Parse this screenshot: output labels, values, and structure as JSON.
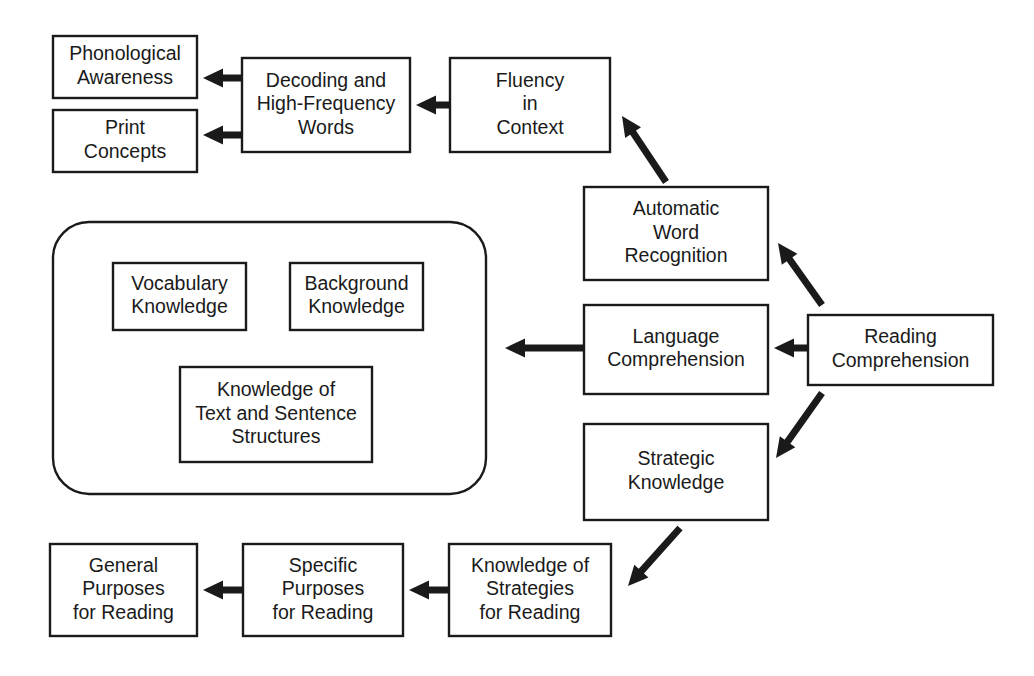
{
  "diagram": {
    "type": "flow-diagram",
    "background_color": "#ffffff",
    "line_color": "#1a1a1a",
    "box_fill": "#ffffff",
    "nodes": [
      {
        "id": "phonological-awareness",
        "lines": [
          "Phonological",
          "Awareness"
        ],
        "x": 53,
        "y": 36,
        "w": 144,
        "h": 62
      },
      {
        "id": "print-concepts",
        "lines": [
          "Print",
          "Concepts"
        ],
        "x": 53,
        "y": 110,
        "w": 144,
        "h": 62
      },
      {
        "id": "decoding-and-high-frequency-words",
        "lines": [
          "Decoding and",
          "High-Frequency",
          "Words"
        ],
        "x": 242,
        "y": 58,
        "w": 168,
        "h": 94
      },
      {
        "id": "fluency-in-context",
        "lines": [
          "Fluency",
          "in",
          "Context"
        ],
        "x": 450,
        "y": 58,
        "w": 160,
        "h": 94
      },
      {
        "id": "automatic-word-recognition",
        "lines": [
          "Automatic",
          "Word",
          "Recognition"
        ],
        "x": 584,
        "y": 187,
        "w": 184,
        "h": 93
      },
      {
        "id": "language-comprehension",
        "lines": [
          "Language",
          "Comprehension"
        ],
        "x": 584,
        "y": 305,
        "w": 184,
        "h": 89
      },
      {
        "id": "strategic-knowledge",
        "lines": [
          "Strategic",
          "Knowledge"
        ],
        "x": 584,
        "y": 424,
        "w": 184,
        "h": 96
      },
      {
        "id": "reading-comprehension",
        "lines": [
          "Reading",
          "Comprehension"
        ],
        "x": 808,
        "y": 315,
        "w": 185,
        "h": 70
      },
      {
        "id": "vocabulary-knowledge",
        "lines": [
          "Vocabulary",
          "Knowledge"
        ],
        "x": 113,
        "y": 263,
        "w": 133,
        "h": 67
      },
      {
        "id": "background-knowledge",
        "lines": [
          "Background",
          "Knowledge"
        ],
        "x": 290,
        "y": 263,
        "w": 133,
        "h": 67
      },
      {
        "id": "knowledge-of-text-and-sentence-structures",
        "lines": [
          "Knowledge of",
          "Text and Sentence",
          "Structures"
        ],
        "x": 180,
        "y": 367,
        "w": 192,
        "h": 95
      },
      {
        "id": "general-purposes-for-reading",
        "lines": [
          "General",
          "Purposes",
          "for Reading"
        ],
        "x": 50,
        "y": 544,
        "w": 147,
        "h": 92
      },
      {
        "id": "specific-purposes-for-reading",
        "lines": [
          "Specific",
          "Purposes",
          "for Reading"
        ],
        "x": 243,
        "y": 544,
        "w": 160,
        "h": 92
      },
      {
        "id": "knowledge-of-strategies-for-reading",
        "lines": [
          "Knowledge of",
          "Strategies",
          "for Reading"
        ],
        "x": 449,
        "y": 544,
        "w": 162,
        "h": 92
      }
    ],
    "group_container": {
      "id": "language-comprehension-group",
      "x": 53,
      "y": 222,
      "w": 433,
      "h": 272,
      "radius": 36
    },
    "edges": [
      {
        "id": "edge-decoding-to-phonological-awareness",
        "from": "decoding-and-high-frequency-words",
        "to": "phonological-awareness",
        "x1": 242,
        "y1": 78,
        "x2": 203,
        "y2": 78
      },
      {
        "id": "edge-decoding-to-print-concepts",
        "from": "decoding-and-high-frequency-words",
        "to": "print-concepts",
        "x1": 242,
        "y1": 135,
        "x2": 203,
        "y2": 135
      },
      {
        "id": "edge-fluency-to-decoding",
        "from": "fluency-in-context",
        "to": "decoding-and-high-frequency-words",
        "x1": 450,
        "y1": 105,
        "x2": 416,
        "y2": 105
      },
      {
        "id": "edge-automatic-word-recognition-to-fluency",
        "from": "automatic-word-recognition",
        "to": "fluency-in-context",
        "x1": 666,
        "y1": 182,
        "x2": 622,
        "y2": 116
      },
      {
        "id": "edge-reading-comprehension-to-automatic-word-recognition",
        "from": "reading-comprehension",
        "to": "automatic-word-recognition",
        "x1": 822,
        "y1": 305,
        "x2": 778,
        "y2": 243
      },
      {
        "id": "edge-reading-comprehension-to-language-comprehension",
        "from": "reading-comprehension",
        "to": "language-comprehension",
        "x1": 808,
        "y1": 348,
        "x2": 774,
        "y2": 348
      },
      {
        "id": "edge-reading-comprehension-to-strategic-knowledge",
        "from": "reading-comprehension",
        "to": "strategic-knowledge",
        "x1": 822,
        "y1": 393,
        "x2": 776,
        "y2": 458
      },
      {
        "id": "edge-language-comprehension-to-group",
        "from": "language-comprehension",
        "to": "language-comprehension-group",
        "x1": 584,
        "y1": 348,
        "x2": 505,
        "y2": 348
      },
      {
        "id": "edge-strategic-knowledge-to-knowledge-of-strategies",
        "from": "strategic-knowledge",
        "to": "knowledge-of-strategies-for-reading",
        "x1": 680,
        "y1": 528,
        "x2": 628,
        "y2": 586
      },
      {
        "id": "edge-knowledge-of-strategies-to-specific-purposes",
        "from": "knowledge-of-strategies-for-reading",
        "to": "specific-purposes-for-reading",
        "x1": 449,
        "y1": 590,
        "x2": 409,
        "y2": 590
      },
      {
        "id": "edge-specific-purposes-to-general-purposes",
        "from": "specific-purposes-for-reading",
        "to": "general-purposes-for-reading",
        "x1": 243,
        "y1": 590,
        "x2": 203,
        "y2": 590
      }
    ]
  }
}
